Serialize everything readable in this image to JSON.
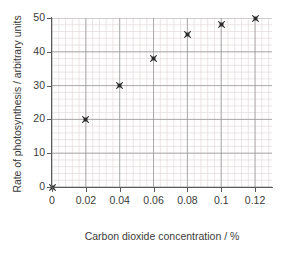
{
  "chart_data": {
    "type": "scatter",
    "title": "",
    "xlabel": "Carbon dioxide concentration / %",
    "ylabel": "Rate of photosynthesis / arbitrary units",
    "x": [
      0,
      0.02,
      0.04,
      0.06,
      0.08,
      0.1,
      0.12
    ],
    "values": [
      0,
      20,
      30,
      38,
      45,
      48,
      50
    ],
    "xlim": [
      0,
      0.13
    ],
    "ylim": [
      0,
      50
    ],
    "xticks": [
      0,
      0.02,
      0.04,
      0.06,
      0.08,
      0.1,
      0.12
    ],
    "xtick_labels": [
      "0",
      "0.02",
      "0.04",
      "0.06",
      "0.08",
      "0.1",
      "0.12"
    ],
    "yticks": [
      0,
      10,
      20,
      30,
      40,
      50
    ],
    "ytick_labels": [
      "0",
      "10",
      "20",
      "30",
      "40",
      "50"
    ],
    "grid": true,
    "minor_grid": true,
    "x_minor_step": 0.004,
    "y_minor_step": 2,
    "legend": null,
    "marker": "cross-square",
    "marker_color": "#2b2b2b",
    "grid_major_color": "#9a9a9a",
    "grid_minor_color": "#e3dada",
    "axis_color": "#5a5a5a",
    "text_color": "#3b3b3b",
    "background": "#ffffff"
  }
}
